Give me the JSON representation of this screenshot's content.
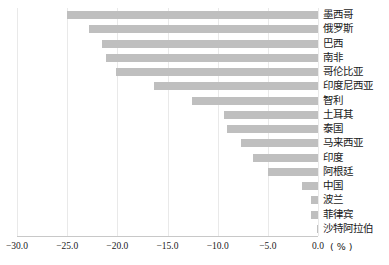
{
  "chart_data": {
    "type": "bar",
    "orientation": "horizontal",
    "title": "",
    "xlabel": "(%)",
    "ylabel": "",
    "xlim": [
      -30.0,
      0.0
    ],
    "xticks": [
      "-30.0",
      "-25.0",
      "-20.0",
      "-15.0",
      "-10.0",
      "-5.0",
      "0.0"
    ],
    "xtick_values": [
      -30.0,
      -25.0,
      -20.0,
      -15.0,
      -10.0,
      -5.0,
      0.0
    ],
    "grid": true,
    "legend": false,
    "bar_color": "#bfbfbf",
    "categories": [
      "墨西哥",
      "俄罗斯",
      "巴西",
      "南非",
      "哥伦比亚",
      "印度尼西亚",
      "智利",
      "土耳其",
      "泰国",
      "马来西亚",
      "印度",
      "阿根廷",
      "中国",
      "波兰",
      "菲律宾",
      "沙特阿拉伯"
    ],
    "values": [
      -25.0,
      -22.8,
      -21.5,
      -21.1,
      -20.1,
      -16.3,
      -12.6,
      -9.4,
      -9.1,
      -7.7,
      -6.5,
      -5.0,
      -1.6,
      -0.7,
      -0.7,
      -0.1
    ]
  },
  "axis": {
    "unit_text": "( % )"
  }
}
